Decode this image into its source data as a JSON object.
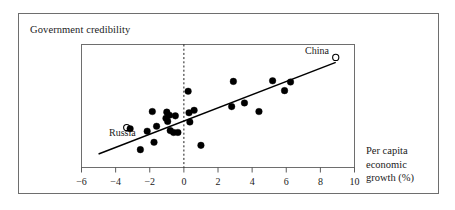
{
  "figure": {
    "title": "Government credibility",
    "background_color": "#ffffff",
    "frame_color": "#6e6e6e",
    "ink_color": "#000000"
  },
  "axis_label": {
    "lines": [
      "Per capita",
      "economic",
      "growth (%)"
    ]
  },
  "annotations": {
    "china": {
      "label": "China",
      "marker": "open-circle"
    },
    "russia": {
      "label": "Russia",
      "marker": "open-circle"
    }
  },
  "chart_data": {
    "type": "scatter",
    "title": "Government credibility",
    "xlabel": "Per capita economic growth (%)",
    "ylabel": "Government credibility",
    "xlim": [
      -6,
      10
    ],
    "ylim": [
      0,
      10
    ],
    "grid": false,
    "legend": "none",
    "xticks": [
      -6,
      -4,
      -2,
      0,
      2,
      4,
      6,
      8,
      10
    ],
    "yticks": [],
    "reference_line": {
      "orientation": "vertical",
      "x": 0,
      "style": "dashed"
    },
    "trend_line": {
      "style": "solid",
      "x": [
        -5.0,
        8.9
      ],
      "y": [
        1.1,
        8.55
      ]
    },
    "points": [
      {
        "x": -3.35,
        "y": 3.25,
        "marker": "open-circle",
        "label": "Russia"
      },
      {
        "x": -3.15,
        "y": 3.15,
        "marker": "filled-circle"
      },
      {
        "x": -2.55,
        "y": 1.45,
        "marker": "filled-circle"
      },
      {
        "x": -2.15,
        "y": 2.95,
        "marker": "filled-circle"
      },
      {
        "x": -1.85,
        "y": 4.55,
        "marker": "filled-circle"
      },
      {
        "x": -1.75,
        "y": 2.05,
        "marker": "filled-circle"
      },
      {
        "x": -1.6,
        "y": 3.35,
        "marker": "filled-circle"
      },
      {
        "x": -1.05,
        "y": 4.0,
        "marker": "filled-circle"
      },
      {
        "x": -1.0,
        "y": 4.5,
        "marker": "filled-circle"
      },
      {
        "x": -0.95,
        "y": 3.75,
        "marker": "filled-circle"
      },
      {
        "x": -0.85,
        "y": 4.25,
        "marker": "filled-circle"
      },
      {
        "x": -0.8,
        "y": 3.0,
        "marker": "filled-circle"
      },
      {
        "x": -0.6,
        "y": 2.85,
        "marker": "filled-circle"
      },
      {
        "x": -0.5,
        "y": 4.2,
        "marker": "filled-circle"
      },
      {
        "x": -0.35,
        "y": 2.85,
        "marker": "filled-circle"
      },
      {
        "x": 0.25,
        "y": 6.2,
        "marker": "filled-circle"
      },
      {
        "x": 0.3,
        "y": 4.45,
        "marker": "filled-circle"
      },
      {
        "x": 0.35,
        "y": 3.7,
        "marker": "filled-circle"
      },
      {
        "x": 0.6,
        "y": 4.65,
        "marker": "filled-circle"
      },
      {
        "x": 1.0,
        "y": 1.8,
        "marker": "filled-circle"
      },
      {
        "x": 2.8,
        "y": 4.95,
        "marker": "filled-circle"
      },
      {
        "x": 2.9,
        "y": 7.0,
        "marker": "filled-circle"
      },
      {
        "x": 3.55,
        "y": 5.25,
        "marker": "filled-circle"
      },
      {
        "x": 4.4,
        "y": 4.55,
        "marker": "filled-circle"
      },
      {
        "x": 5.2,
        "y": 7.05,
        "marker": "filled-circle"
      },
      {
        "x": 5.9,
        "y": 6.25,
        "marker": "filled-circle"
      },
      {
        "x": 6.25,
        "y": 6.95,
        "marker": "filled-circle"
      },
      {
        "x": 8.9,
        "y": 8.95,
        "marker": "open-circle",
        "label": "China"
      }
    ]
  }
}
